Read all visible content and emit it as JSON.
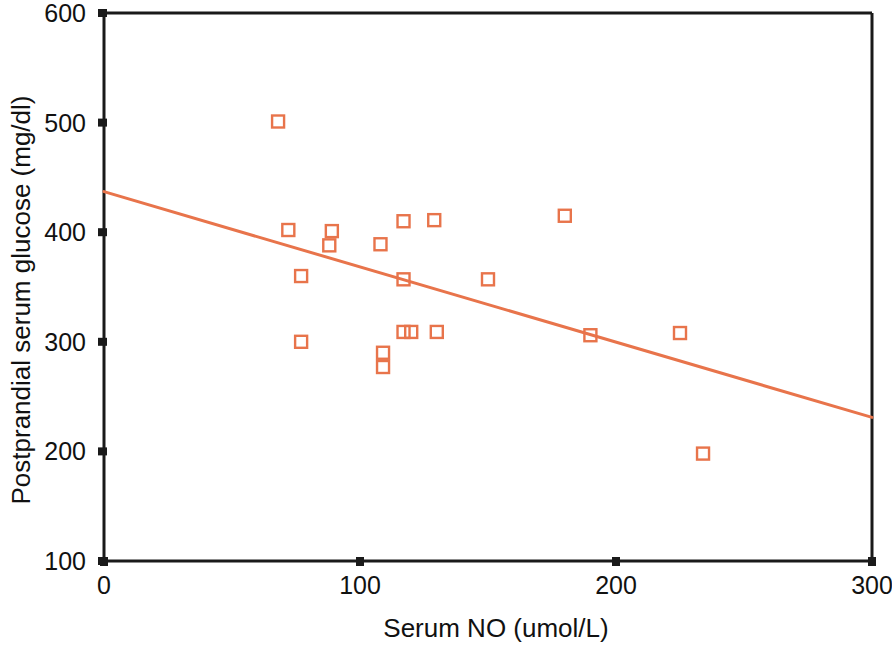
{
  "chart_data": {
    "type": "scatter",
    "title": "",
    "xlabel": "Serum NO (umol/L)",
    "ylabel": "Postprandial serum glucose (mg/dl)",
    "xlim": [
      0,
      300
    ],
    "ylim": [
      100,
      600
    ],
    "xticks": [
      0,
      100,
      200,
      300
    ],
    "yticks": [
      100,
      200,
      300,
      400,
      500,
      600
    ],
    "xtick_labels": [
      "0",
      "100",
      "200",
      "300"
    ],
    "ytick_labels": [
      "100",
      "200",
      "300",
      "400",
      "500",
      "600"
    ],
    "grid": false,
    "legend": "none",
    "marker": "open-square",
    "marker_color": "#E8744B",
    "line_color": "#E8744B",
    "axis_color": "#1A1A1A",
    "background_color": "#FFFFFF",
    "series": [
      {
        "name": "Patients",
        "points": [
          {
            "x": 68,
            "y": 501
          },
          {
            "x": 72,
            "y": 402
          },
          {
            "x": 77,
            "y": 360
          },
          {
            "x": 77,
            "y": 300
          },
          {
            "x": 88,
            "y": 388
          },
          {
            "x": 89,
            "y": 401
          },
          {
            "x": 108,
            "y": 389
          },
          {
            "x": 109,
            "y": 290
          },
          {
            "x": 109,
            "y": 277
          },
          {
            "x": 117,
            "y": 410
          },
          {
            "x": 117,
            "y": 357
          },
          {
            "x": 117,
            "y": 309
          },
          {
            "x": 120,
            "y": 309
          },
          {
            "x": 129,
            "y": 411
          },
          {
            "x": 130,
            "y": 309
          },
          {
            "x": 150,
            "y": 357
          },
          {
            "x": 180,
            "y": 415
          },
          {
            "x": 190,
            "y": 306
          },
          {
            "x": 225,
            "y": 308
          },
          {
            "x": 234,
            "y": 198
          }
        ]
      }
    ],
    "fit_line": {
      "name": "linear regression",
      "x_start": 0,
      "y_start": 437,
      "x_end": 300,
      "y_end": 231
    }
  }
}
